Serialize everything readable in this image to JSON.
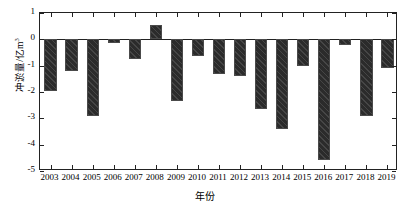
{
  "chart_data": {
    "type": "bar",
    "title": "",
    "xlabel": "年份",
    "ylabel": "冲淤量/亿m³",
    "ylabel_main": "冲淤量/亿m",
    "ylabel_sup": "3",
    "categories": [
      "2003",
      "2004",
      "2005",
      "2006",
      "2007",
      "2008",
      "2009",
      "2010",
      "2011",
      "2012",
      "2013",
      "2014",
      "2015",
      "2016",
      "2017",
      "2018",
      "2019"
    ],
    "values": [
      -1.95,
      -1.2,
      -2.9,
      -0.15,
      -0.75,
      0.55,
      -2.35,
      -0.65,
      -1.3,
      -1.4,
      -2.65,
      -3.4,
      -1.0,
      -4.6,
      -0.2,
      -2.9,
      -1.1
    ],
    "ylim": [
      -5,
      1
    ],
    "yticks": [
      1,
      0,
      -1,
      -2,
      -3,
      -4,
      -5
    ],
    "ytick_labels": [
      "1",
      "0",
      "-1",
      "-2",
      "-3",
      "-4",
      "-5"
    ],
    "grid": false,
    "legend": null,
    "bar_color": "#2b2b2b",
    "axis_color": "#222222",
    "series_name": "冲淤量"
  }
}
